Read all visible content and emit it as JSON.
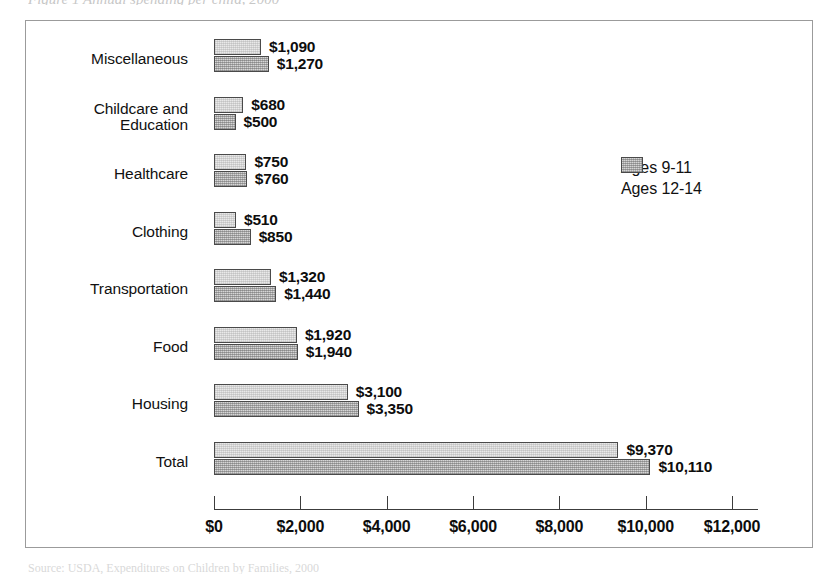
{
  "top_caption": "Figure 1  Annual spending per child, 2000",
  "bottom_caption": "Source: USDA, Expenditures on Children by Families, 2000",
  "legend": {
    "position": "right",
    "items": [
      {
        "label": "Ages 9-11",
        "key": "ages_9_11",
        "swatch": "light"
      },
      {
        "label": "Ages 12-14",
        "key": "ages_12_14",
        "swatch": "dark"
      }
    ]
  },
  "axis": {
    "ticks": [
      "$0",
      "$2,000",
      "$4,000",
      "$6,000",
      "$8,000",
      "$10,000",
      "$12,000"
    ],
    "tick_values": [
      0,
      2000,
      4000,
      6000,
      8000,
      10000,
      12000
    ],
    "min": 0,
    "max": 12000
  },
  "colors": {
    "bar_light": "#e9e9e9",
    "bar_dark": "#b4b4b4",
    "bar_border": "#4a4a4a",
    "axis": "#3c3c3c",
    "frame": "#9b9b9b",
    "text": "#111111"
  },
  "chart_data": {
    "type": "bar",
    "orientation": "horizontal",
    "title": "Figure 1  Annual spending per child, 2000",
    "xlabel": "",
    "ylabel": "",
    "xlim": [
      0,
      12000
    ],
    "grid": false,
    "legend_position": "right",
    "categories": [
      "Miscellaneous",
      "Childcare and Education",
      "Healthcare",
      "Clothing",
      "Transportation",
      "Food",
      "Housing",
      "Total"
    ],
    "category_lines": [
      [
        "Miscellaneous"
      ],
      [
        "Childcare and",
        "Education"
      ],
      [
        "Healthcare"
      ],
      [
        "Clothing"
      ],
      [
        "Transportation"
      ],
      [
        "Food"
      ],
      [
        "Housing"
      ],
      [
        "Total"
      ]
    ],
    "series": [
      {
        "name": "Ages 9-11",
        "values": [
          1090,
          680,
          750,
          510,
          1320,
          1920,
          3100,
          9370
        ],
        "labels": [
          "$1,090",
          "$680",
          "$750",
          "$510",
          "$1,320",
          "$1,920",
          "$3,100",
          "$9,370"
        ]
      },
      {
        "name": "Ages 12-14",
        "values": [
          1270,
          500,
          760,
          850,
          1440,
          1940,
          3350,
          10110
        ],
        "labels": [
          "$1,270",
          "$500",
          "$760",
          "$850",
          "$1,440",
          "$1,940",
          "$3,350",
          "$10,110"
        ]
      }
    ]
  }
}
